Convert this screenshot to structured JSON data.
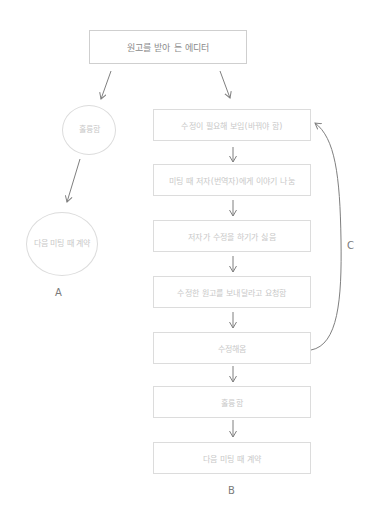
{
  "diagram": {
    "type": "flowchart",
    "style": "hand-drawn sketch",
    "colors": {
      "stroke": "#8a8a8a",
      "box_border": "#dcdcdc",
      "faint_text": "#c8c8c8",
      "top_text": "#8a8a8a",
      "background": "#ffffff"
    },
    "start": {
      "label": "원고를 받아 든 에디터"
    },
    "path_a": {
      "id": "A",
      "nodes": [
        {
          "label": "훌륭함"
        },
        {
          "label": "다음 미팅 때 계약"
        }
      ]
    },
    "path_b": {
      "id": "B",
      "nodes": [
        {
          "label": "수정이 필요해 보임(바꿔야 함)"
        },
        {
          "label": "미팅 때 저자(번역자)에게 이야기 나눔"
        },
        {
          "label": "저자가 수정을 하기가 싫음"
        },
        {
          "label": "수정한 원고를 보내달라고 요청함"
        },
        {
          "label": "수정해옴"
        },
        {
          "label": "훌륭함"
        },
        {
          "label": "다음 미팅 때 계약"
        }
      ]
    },
    "loop_c": {
      "id": "C",
      "from": "수정해옴",
      "to": "수정이 필요해 보임(바꿔야 함)"
    }
  }
}
